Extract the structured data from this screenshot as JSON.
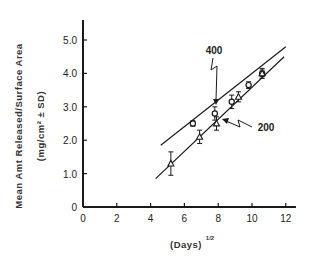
{
  "chart_data": {
    "type": "line",
    "title": "",
    "xlabel": "(Days)",
    "xlabel_superscript": "1/2",
    "ylabel": "Mean Amt Released/Surface Area",
    "ylabel_units": "(mg/cm² ± SD)",
    "xlim": [
      0,
      12.6
    ],
    "ylim": [
      0,
      5.6
    ],
    "x_ticks": [
      0,
      2,
      4,
      6,
      8,
      10,
      12
    ],
    "x_tick_labels": [
      "0",
      "2",
      "4",
      "6",
      "8",
      "10",
      "12"
    ],
    "y_ticks": [
      0,
      1,
      2,
      3,
      4,
      5
    ],
    "y_tick_labels": [
      "0",
      "1.0",
      "2.0",
      "3.0",
      "4.0",
      "5.0"
    ],
    "grid": false,
    "series": [
      {
        "name": "400",
        "marker": "circle",
        "x": [
          6.5,
          7.8,
          8.8,
          9.8,
          10.6
        ],
        "y": [
          2.5,
          2.8,
          3.15,
          3.65,
          4.0
        ],
        "sd": [
          0.08,
          0.2,
          0.2,
          0.1,
          0.15
        ],
        "fit_line": {
          "x": [
            4.6,
            12.0
          ],
          "y": [
            1.85,
            4.8
          ]
        }
      },
      {
        "name": "200",
        "marker": "triangle",
        "x": [
          5.2,
          6.9,
          7.9,
          9.2,
          10.6
        ],
        "y": [
          1.3,
          2.1,
          2.5,
          3.3,
          4.0
        ],
        "sd": [
          0.35,
          0.2,
          0.2,
          0.15,
          0.1
        ],
        "fit_line": {
          "x": [
            4.3,
            11.9
          ],
          "y": [
            0.85,
            4.5
          ]
        }
      }
    ],
    "annotations": [
      {
        "text": "400",
        "points_to_series": "400"
      },
      {
        "text": "200",
        "points_to_series": "200"
      }
    ]
  }
}
